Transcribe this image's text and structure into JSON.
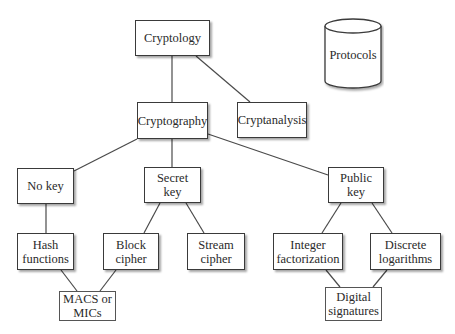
{
  "diagram": {
    "type": "tree",
    "nodes": {
      "cryptology": {
        "label": "Cryptology"
      },
      "protocols": {
        "label": "Protocols",
        "shape": "cylinder"
      },
      "cryptography": {
        "label": "Cryptography"
      },
      "cryptanalysis": {
        "label": "Cryptanalysis"
      },
      "no_key": {
        "label": "No key"
      },
      "secret_key": {
        "label": "Secret\nkey"
      },
      "public_key": {
        "label": "Public key"
      },
      "hash_functions": {
        "label": "Hash\nfunctions"
      },
      "block_cipher": {
        "label": "Block\ncipher"
      },
      "stream_cipher": {
        "label": "Stream\ncipher"
      },
      "integer_factorization": {
        "label": "Integer\nfactorization"
      },
      "discrete_logarithms": {
        "label": "Discrete\nlogarithms"
      },
      "macs_or_mics": {
        "label": "MACS or\nMICs"
      },
      "digital_signatures": {
        "label": "Digital\nsignatures"
      }
    },
    "edges": [
      [
        "Cryptology",
        "Cryptography"
      ],
      [
        "Cryptology",
        "Cryptanalysis"
      ],
      [
        "Cryptography",
        "No key"
      ],
      [
        "Cryptography",
        "Secret key"
      ],
      [
        "Cryptography",
        "Public key"
      ],
      [
        "No key",
        "Hash functions"
      ],
      [
        "Secret key",
        "Block cipher"
      ],
      [
        "Secret key",
        "Stream cipher"
      ],
      [
        "Public key",
        "Integer factorization"
      ],
      [
        "Public key",
        "Discrete logarithms"
      ],
      [
        "Hash functions",
        "MACS or MICs"
      ],
      [
        "Block cipher",
        "MACS or MICs"
      ],
      [
        "Integer factorization",
        "Digital signatures"
      ],
      [
        "Discrete logarithms",
        "Digital signatures"
      ]
    ]
  }
}
